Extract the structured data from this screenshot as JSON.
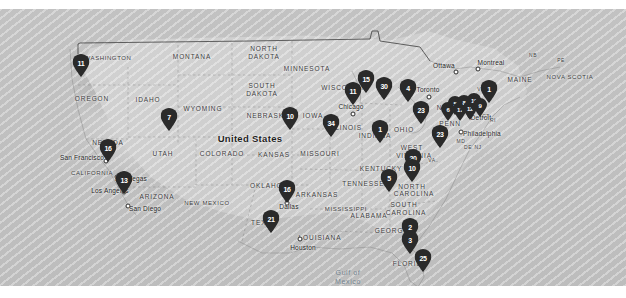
{
  "view": {
    "type": "map",
    "title": "United States",
    "background_color": "#bdbdbd",
    "land_color": "#cfcfcf",
    "marker_color": "#2a2a2a",
    "marker_text_color": "#ffffff"
  },
  "country_labels": [
    {
      "text": "United States",
      "x": 250,
      "y": 138
    }
  ],
  "state_labels": [
    {
      "text": "WASHINGTON",
      "x": 108,
      "y": 58
    },
    {
      "text": "OREGON",
      "x": 92,
      "y": 98
    },
    {
      "text": "IDAHO",
      "x": 148,
      "y": 99
    },
    {
      "text": "MONTANA",
      "x": 192,
      "y": 56
    },
    {
      "text": "WYOMING",
      "x": 203,
      "y": 108
    },
    {
      "text": "NEVADA",
      "x": 108,
      "y": 142
    },
    {
      "text": "UTAH",
      "x": 163,
      "y": 153
    },
    {
      "text": "CALIFORNIA",
      "x": 92,
      "y": 173
    },
    {
      "text": "ARIZONA",
      "x": 157,
      "y": 196
    },
    {
      "text": "NEW MEXICO",
      "x": 207,
      "y": 203
    },
    {
      "text": "COLORADO",
      "x": 222,
      "y": 153
    },
    {
      "text": "NORTH",
      "x": 264,
      "y": 48
    },
    {
      "text": "DAKOTA",
      "x": 264,
      "y": 56
    },
    {
      "text": "SOUTH",
      "x": 262,
      "y": 85
    },
    {
      "text": "DAKOTA",
      "x": 262,
      "y": 93
    },
    {
      "text": "NEBRASKA",
      "x": 268,
      "y": 115
    },
    {
      "text": "KANSAS",
      "x": 274,
      "y": 154
    },
    {
      "text": "OKLAHOMA",
      "x": 272,
      "y": 185
    },
    {
      "text": "TEXAS",
      "x": 264,
      "y": 222
    },
    {
      "text": "MINNESOTA",
      "x": 307,
      "y": 68
    },
    {
      "text": "IOWA",
      "x": 313,
      "y": 115
    },
    {
      "text": "MISSOURI",
      "x": 320,
      "y": 153
    },
    {
      "text": "ARKANSAS",
      "x": 317,
      "y": 194
    },
    {
      "text": "LOUISIANA",
      "x": 320,
      "y": 237
    },
    {
      "text": "WISCONSIN",
      "x": 344,
      "y": 87
    },
    {
      "text": "ILLINOIS",
      "x": 345,
      "y": 127
    },
    {
      "text": "INDIANA",
      "x": 375,
      "y": 135
    },
    {
      "text": "MISSISSIPPI",
      "x": 346,
      "y": 209
    },
    {
      "text": "ALABAMA",
      "x": 369,
      "y": 215
    },
    {
      "text": "TENNESSEE",
      "x": 366,
      "y": 183
    },
    {
      "text": "KENTUCKY",
      "x": 381,
      "y": 168
    },
    {
      "text": "OHIO",
      "x": 404,
      "y": 129
    },
    {
      "text": "WEST",
      "x": 412,
      "y": 147
    },
    {
      "text": "VIRGINIA",
      "x": 414,
      "y": 155
    },
    {
      "text": "GEORGIA",
      "x": 393,
      "y": 230
    },
    {
      "text": "NORTH",
      "x": 412,
      "y": 186
    },
    {
      "text": "CAROLINA",
      "x": 414,
      "y": 193
    },
    {
      "text": "SOUTH",
      "x": 404,
      "y": 204
    },
    {
      "text": "CAROLINA",
      "x": 406,
      "y": 212
    },
    {
      "text": "FLORIDA",
      "x": 410,
      "y": 263
    },
    {
      "text": "NEW YORK",
      "x": 458,
      "y": 107
    },
    {
      "text": "PENN",
      "x": 450,
      "y": 123
    },
    {
      "text": "MAINE",
      "x": 520,
      "y": 79
    },
    {
      "text": "NOVA SCOTIA",
      "x": 570,
      "y": 77
    },
    {
      "text": "VT",
      "x": 481,
      "y": 89
    },
    {
      "text": "NB",
      "x": 533,
      "y": 55
    },
    {
      "text": "PE",
      "x": 561,
      "y": 60
    },
    {
      "text": "MD",
      "x": 461,
      "y": 141
    },
    {
      "text": "DE",
      "x": 468,
      "y": 147
    },
    {
      "text": "NJ",
      "x": 478,
      "y": 147
    },
    {
      "text": "RI",
      "x": 493,
      "y": 120
    },
    {
      "text": "CT",
      "x": 486,
      "y": 116
    },
    {
      "text": "VA",
      "x": 432,
      "y": 160
    }
  ],
  "city_labels": [
    {
      "text": "San Francisco",
      "x": 82,
      "y": 157,
      "dot_x": 106,
      "dot_y": 161
    },
    {
      "text": "Los Angeles",
      "x": 110,
      "y": 190,
      "dot_x": 124,
      "dot_y": 192
    },
    {
      "text": "San Diego",
      "x": 145,
      "y": 208,
      "dot_x": 128,
      "dot_y": 206
    },
    {
      "text": "Las Vegas",
      "x": 131,
      "y": 178,
      "dot_x": 117,
      "dot_y": 177
    },
    {
      "text": "Dallas",
      "x": 289,
      "y": 206,
      "dot_x": 287,
      "dot_y": 203
    },
    {
      "text": "Houston",
      "x": 303,
      "y": 247,
      "dot_x": 300,
      "dot_y": 239
    },
    {
      "text": "Chicago",
      "x": 351,
      "y": 106,
      "dot_x": 353,
      "dot_y": 114
    },
    {
      "text": "Philadelphia",
      "x": 482,
      "y": 133,
      "dot_x": 461,
      "dot_y": 132
    },
    {
      "text": "Toronto",
      "x": 428,
      "y": 89,
      "dot_x": 429,
      "dot_y": 97
    },
    {
      "text": "Ottawa",
      "x": 444,
      "y": 65,
      "dot_x": 456,
      "dot_y": 72
    },
    {
      "text": "Montreal",
      "x": 491,
      "y": 62,
      "dot_x": 478,
      "dot_y": 69
    },
    {
      "text": "Detroit",
      "x": 481,
      "y": 117,
      "dot_x": 470,
      "dot_y": 116
    }
  ],
  "water_labels": [
    {
      "text": "Gulf of",
      "x": 348,
      "y": 272
    },
    {
      "text": "Mexico",
      "x": 348,
      "y": 281
    }
  ],
  "markers": [
    {
      "label": "11",
      "x": 81,
      "y": 77,
      "size": "md",
      "region": "Washington / Seattle"
    },
    {
      "label": "7",
      "x": 169,
      "y": 131,
      "size": "md",
      "region": "Utah / Salt Lake City"
    },
    {
      "label": "16",
      "x": 108,
      "y": 162,
      "size": "md",
      "region": "San Francisco"
    },
    {
      "label": "13",
      "x": 124,
      "y": 194,
      "size": "md",
      "region": "Los Angeles"
    },
    {
      "label": "10",
      "x": 290,
      "y": 130,
      "size": "md",
      "region": "Iowa / Missouri"
    },
    {
      "label": "16",
      "x": 287,
      "y": 203,
      "size": "md",
      "region": "Dallas"
    },
    {
      "label": "21",
      "x": 271,
      "y": 233,
      "size": "md",
      "region": "Texas"
    },
    {
      "label": "34",
      "x": 331,
      "y": 137,
      "size": "md",
      "region": "Missouri / Illinois"
    },
    {
      "label": "15",
      "x": 366,
      "y": 93,
      "size": "md",
      "region": "Wisconsin"
    },
    {
      "label": "11",
      "x": 353,
      "y": 105,
      "size": "md",
      "region": "Chicago"
    },
    {
      "label": "30",
      "x": 384,
      "y": 100,
      "size": "md",
      "region": "Michigan"
    },
    {
      "label": "1",
      "x": 380,
      "y": 143,
      "size": "md",
      "region": "Indiana / Ohio"
    },
    {
      "label": "4",
      "x": 408,
      "y": 102,
      "size": "md",
      "region": "Ohio / Lake Erie"
    },
    {
      "label": "23",
      "x": 421,
      "y": 124,
      "size": "md",
      "region": "Pennsylvania"
    },
    {
      "label": "6",
      "x": 448,
      "y": 121,
      "size": "sm",
      "region": "Pennsylvania East"
    },
    {
      "label": "5",
      "x": 455,
      "y": 115,
      "size": "sm",
      "region": "New Jersey"
    },
    {
      "label": "17",
      "x": 460,
      "y": 121,
      "size": "sm",
      "region": "New York City"
    },
    {
      "label": "8",
      "x": 464,
      "y": 114,
      "size": "sm",
      "region": "Connecticut"
    },
    {
      "label": "12",
      "x": 470,
      "y": 120,
      "size": "sm",
      "region": "New York"
    },
    {
      "label": "10",
      "x": 474,
      "y": 112,
      "size": "sm",
      "region": "Massachusetts"
    },
    {
      "label": "9",
      "x": 480,
      "y": 117,
      "size": "sm",
      "region": "Rhode Island"
    },
    {
      "label": "1",
      "x": 489,
      "y": 103,
      "size": "md",
      "region": "New England"
    },
    {
      "label": "23",
      "x": 440,
      "y": 148,
      "size": "md",
      "region": "Maryland / Virginia"
    },
    {
      "label": "20",
      "x": 413,
      "y": 172,
      "size": "md",
      "region": "Virginia"
    },
    {
      "label": "10",
      "x": 412,
      "y": 182,
      "size": "md",
      "region": "North Carolina"
    },
    {
      "label": "5",
      "x": 389,
      "y": 192,
      "size": "md",
      "region": "Tennessee"
    },
    {
      "label": "2",
      "x": 410,
      "y": 241,
      "size": "md",
      "region": "Georgia"
    },
    {
      "label": "3",
      "x": 410,
      "y": 254,
      "size": "md",
      "region": "North Florida"
    },
    {
      "label": "25",
      "x": 423,
      "y": 272,
      "size": "md",
      "region": "South Florida"
    }
  ]
}
